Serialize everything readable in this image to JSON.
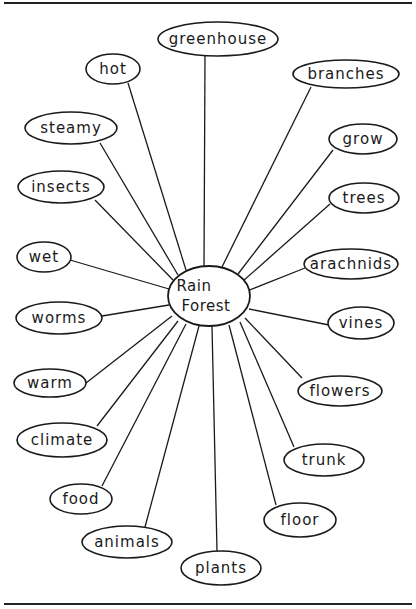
{
  "diagram": {
    "type": "concept-web",
    "center": {
      "line1": "Rain",
      "line2": "Forest",
      "cx": 209,
      "cy": 296,
      "rx": 41,
      "ry": 30
    },
    "nodes": [
      {
        "label": "greenhouse",
        "cx": 218,
        "cy": 39,
        "rx": 60,
        "ry": 17,
        "ax": 205,
        "ay": 56,
        "bx": 204,
        "by": 266
      },
      {
        "label": "hot",
        "cx": 113,
        "cy": 69,
        "rx": 27,
        "ry": 15,
        "ax": 128,
        "ay": 83,
        "bx": 186,
        "by": 270
      },
      {
        "label": "branches",
        "cx": 346,
        "cy": 74,
        "rx": 53,
        "ry": 14,
        "ax": 311,
        "ay": 87,
        "bx": 222,
        "by": 267
      },
      {
        "label": "steamy",
        "cx": 71,
        "cy": 128,
        "rx": 46,
        "ry": 16,
        "ax": 100,
        "ay": 143,
        "bx": 178,
        "by": 275
      },
      {
        "label": "grow",
        "cx": 363,
        "cy": 139,
        "rx": 34,
        "ry": 15,
        "ax": 333,
        "ay": 150,
        "bx": 238,
        "by": 274
      },
      {
        "label": "insects",
        "cx": 61,
        "cy": 187,
        "rx": 43,
        "ry": 16,
        "ax": 95,
        "ay": 200,
        "bx": 173,
        "by": 280
      },
      {
        "label": "trees",
        "cx": 364,
        "cy": 198,
        "rx": 35,
        "ry": 15,
        "ax": 330,
        "ay": 204,
        "bx": 243,
        "by": 281
      },
      {
        "label": "wet",
        "cx": 44,
        "cy": 257,
        "rx": 27,
        "ry": 15,
        "ax": 70,
        "ay": 260,
        "bx": 169,
        "by": 289
      },
      {
        "label": "arachnids",
        "cx": 351,
        "cy": 264,
        "rx": 47,
        "ry": 15,
        "ax": 305,
        "ay": 268,
        "bx": 247,
        "by": 291
      },
      {
        "label": "worms",
        "cx": 59,
        "cy": 318,
        "rx": 43,
        "ry": 16,
        "ax": 102,
        "ay": 316,
        "bx": 169,
        "by": 305
      },
      {
        "label": "vines",
        "cx": 361,
        "cy": 323,
        "rx": 33,
        "ry": 16,
        "ax": 329,
        "ay": 325,
        "bx": 249,
        "by": 309
      },
      {
        "label": "warm",
        "cx": 50,
        "cy": 383,
        "rx": 36,
        "ry": 14,
        "ax": 86,
        "ay": 383,
        "bx": 172,
        "by": 316
      },
      {
        "label": "flowers",
        "cx": 340,
        "cy": 391,
        "rx": 42,
        "ry": 15,
        "ax": 302,
        "ay": 378,
        "bx": 245,
        "by": 318
      },
      {
        "label": "climate",
        "cx": 62,
        "cy": 440,
        "rx": 45,
        "ry": 17,
        "ax": 97,
        "ay": 426,
        "bx": 178,
        "by": 321
      },
      {
        "label": "trunk",
        "cx": 324,
        "cy": 460,
        "rx": 40,
        "ry": 16,
        "ax": 294,
        "ay": 447,
        "bx": 240,
        "by": 322
      },
      {
        "label": "food",
        "cx": 81,
        "cy": 499,
        "rx": 31,
        "ry": 15,
        "ax": 102,
        "ay": 486,
        "bx": 186,
        "by": 324
      },
      {
        "label": "floor",
        "cx": 300,
        "cy": 520,
        "rx": 36,
        "ry": 17,
        "ax": 276,
        "ay": 505,
        "bx": 229,
        "by": 325
      },
      {
        "label": "animals",
        "cx": 127,
        "cy": 542,
        "rx": 45,
        "ry": 16,
        "ax": 145,
        "ay": 527,
        "bx": 199,
        "by": 326
      },
      {
        "label": "plants",
        "cx": 221,
        "cy": 568,
        "rx": 40,
        "ry": 17,
        "ax": 217,
        "ay": 551,
        "bx": 212,
        "by": 326
      }
    ]
  },
  "frame": {
    "top_rule_y": 3,
    "bottom_rule_y": 604
  }
}
